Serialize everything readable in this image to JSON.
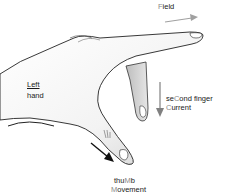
{
  "diagram": {
    "labels": {
      "field": {
        "highlight": "F",
        "rest": "ield"
      },
      "hand_line1": "Left",
      "hand_line2": "hand",
      "second_finger_pre": "se",
      "second_finger_highlight": "C",
      "second_finger_post": "ond finger",
      "current_highlight": "C",
      "current_rest": "urrent",
      "thumb_pre": "thu",
      "thumb_highlight": "M",
      "thumb_post": "b",
      "movement_highlight": "M",
      "movement_rest": "ovement"
    },
    "arrows": {
      "field": {
        "direction": "right",
        "color": "#a0a0a0"
      },
      "current": {
        "direction": "down",
        "color": "#808080"
      },
      "movement": {
        "direction": "down-right",
        "color": "#111111"
      }
    },
    "colors": {
      "text": "#1a1a1a",
      "highlight": "#8a8a8a",
      "outline": "#222222",
      "skin_light": "#ffffff",
      "skin_shade": "#d0d0d0"
    }
  }
}
